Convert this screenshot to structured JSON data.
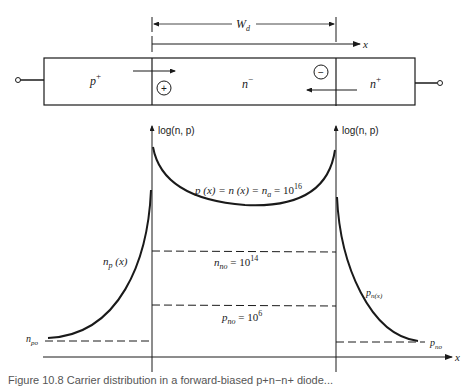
{
  "diagram": {
    "device": {
      "regions": [
        {
          "name": "p-plus",
          "label": "p",
          "sup": "+"
        },
        {
          "name": "n-minus",
          "label": "n",
          "sup": "−"
        },
        {
          "name": "n-plus",
          "label": "n",
          "sup": "+"
        }
      ],
      "depletion_width_label": "W",
      "depletion_width_sub": "d",
      "x_axis_label": "x",
      "ion_charges": [
        {
          "name": "positive-charge",
          "symbol": "+"
        },
        {
          "name": "negative-charge",
          "symbol": "−"
        }
      ]
    },
    "plot": {
      "left_axis_label": "log(n, p)",
      "right_axis_label": "log(n, p)",
      "x_axis_label": "x",
      "curves": {
        "intrinsic_center": {
          "text": "p (x) = n (x) = n",
          "sub": "a",
          "tail": " = 10",
          "exp": "16"
        },
        "n_no": {
          "main": "n",
          "sub": "no",
          "tail": " = 10",
          "exp": "14"
        },
        "p_no_center": {
          "main": "p",
          "sub": "no",
          "tail": " = 10",
          "exp": "6"
        },
        "np_x": {
          "main": "n",
          "sub": "p",
          "tail": " (x)"
        },
        "pn_x": {
          "main": "p",
          "sub": "n(x)"
        },
        "n_po": {
          "main": "n",
          "sub": "po"
        },
        "p_no_right": {
          "main": "p",
          "sub": "no"
        }
      }
    },
    "caption": "Figure 10.8  Carrier distribution in a forward-biased p+n−n+ diode..."
  }
}
